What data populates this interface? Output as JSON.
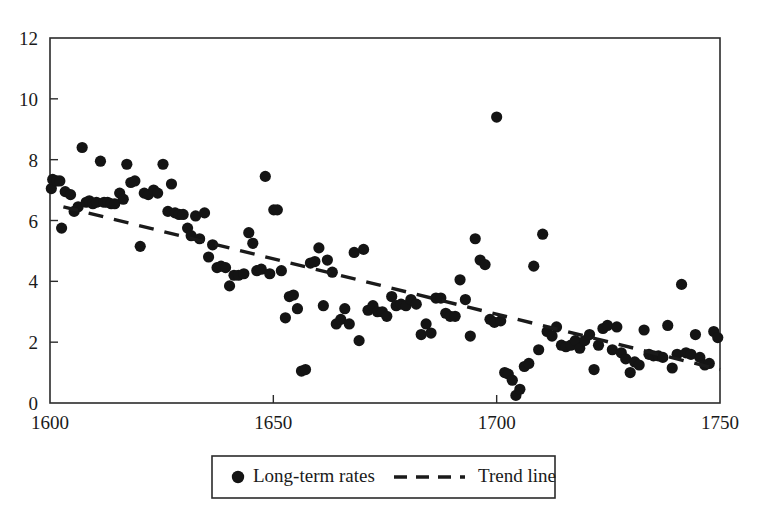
{
  "chart_data": {
    "type": "scatter",
    "title": "",
    "xlabel": "",
    "ylabel": "",
    "xlim": [
      1600,
      1750
    ],
    "ylim": [
      0,
      12
    ],
    "xticks": [
      1600,
      1650,
      1700,
      1750
    ],
    "xticklabels": [
      "1600",
      "1650",
      "1700",
      "1750"
    ],
    "yticks": [
      0,
      2,
      4,
      6,
      8,
      10,
      12
    ],
    "yticklabels": [
      "0",
      "2",
      "4",
      "6",
      "8",
      "10",
      "12"
    ],
    "grid": false,
    "legend_position": "below-axes",
    "marker_color": "#141414",
    "line_color": "#1a1a1a",
    "frame_color": "#2b2b2b",
    "series": [
      {
        "name": "Long-term rates",
        "type": "scatter",
        "marker": "circle",
        "points": [
          [
            1600.3,
            7.05
          ],
          [
            1600.6,
            7.35
          ],
          [
            1601.5,
            7.3
          ],
          [
            1602.2,
            7.3
          ],
          [
            1602.6,
            5.75
          ],
          [
            1603.4,
            6.95
          ],
          [
            1604.6,
            6.85
          ],
          [
            1605.4,
            6.3
          ],
          [
            1606.3,
            6.45
          ],
          [
            1607.2,
            8.4
          ],
          [
            1608.1,
            6.6
          ],
          [
            1608.8,
            6.65
          ],
          [
            1609.6,
            6.55
          ],
          [
            1610.4,
            6.6
          ],
          [
            1611.3,
            7.95
          ],
          [
            1612.1,
            6.6
          ],
          [
            1612.9,
            6.6
          ],
          [
            1613.7,
            6.55
          ],
          [
            1614.5,
            6.55
          ],
          [
            1615.6,
            6.9
          ],
          [
            1616.4,
            6.7
          ],
          [
            1617.2,
            7.85
          ],
          [
            1618.1,
            7.25
          ],
          [
            1619.0,
            7.3
          ],
          [
            1620.2,
            5.15
          ],
          [
            1621.1,
            6.9
          ],
          [
            1622.0,
            6.85
          ],
          [
            1623.2,
            7.0
          ],
          [
            1624.1,
            6.9
          ],
          [
            1625.3,
            7.85
          ],
          [
            1626.4,
            6.3
          ],
          [
            1627.2,
            7.2
          ],
          [
            1628.0,
            6.25
          ],
          [
            1628.9,
            6.2
          ],
          [
            1629.8,
            6.2
          ],
          [
            1630.8,
            5.75
          ],
          [
            1631.6,
            5.5
          ],
          [
            1632.6,
            6.15
          ],
          [
            1633.5,
            5.4
          ],
          [
            1634.6,
            6.25
          ],
          [
            1635.5,
            4.8
          ],
          [
            1636.4,
            5.2
          ],
          [
            1637.4,
            4.45
          ],
          [
            1638.3,
            4.5
          ],
          [
            1639.3,
            4.45
          ],
          [
            1640.2,
            3.85
          ],
          [
            1641.2,
            4.2
          ],
          [
            1642.2,
            4.2
          ],
          [
            1643.4,
            4.25
          ],
          [
            1644.5,
            5.6
          ],
          [
            1645.4,
            5.25
          ],
          [
            1646.3,
            4.35
          ],
          [
            1647.3,
            4.4
          ],
          [
            1648.2,
            7.45
          ],
          [
            1649.2,
            4.25
          ],
          [
            1650.1,
            6.35
          ],
          [
            1650.9,
            6.35
          ],
          [
            1651.8,
            4.35
          ],
          [
            1652.7,
            2.8
          ],
          [
            1653.6,
            3.5
          ],
          [
            1654.5,
            3.55
          ],
          [
            1655.4,
            3.1
          ],
          [
            1656.3,
            1.05
          ],
          [
            1657.2,
            1.1
          ],
          [
            1658.3,
            4.6
          ],
          [
            1659.3,
            4.65
          ],
          [
            1660.2,
            5.1
          ],
          [
            1661.2,
            3.2
          ],
          [
            1662.1,
            4.7
          ],
          [
            1663.2,
            4.3
          ],
          [
            1664.1,
            2.6
          ],
          [
            1665.1,
            2.75
          ],
          [
            1666.0,
            3.1
          ],
          [
            1667.0,
            2.6
          ],
          [
            1668.1,
            4.95
          ],
          [
            1669.2,
            2.05
          ],
          [
            1670.2,
            5.05
          ],
          [
            1671.2,
            3.05
          ],
          [
            1672.3,
            3.2
          ],
          [
            1673.3,
            3.0
          ],
          [
            1674.4,
            3.0
          ],
          [
            1675.4,
            2.85
          ],
          [
            1676.5,
            3.5
          ],
          [
            1677.5,
            3.2
          ],
          [
            1678.6,
            3.25
          ],
          [
            1679.7,
            3.2
          ],
          [
            1680.8,
            3.4
          ],
          [
            1682.0,
            3.25
          ],
          [
            1683.1,
            2.25
          ],
          [
            1684.2,
            2.6
          ],
          [
            1685.3,
            2.3
          ],
          [
            1686.4,
            3.45
          ],
          [
            1687.5,
            3.45
          ],
          [
            1688.6,
            2.95
          ],
          [
            1689.6,
            2.85
          ],
          [
            1690.7,
            2.85
          ],
          [
            1691.8,
            4.05
          ],
          [
            1693.0,
            3.4
          ],
          [
            1694.1,
            2.2
          ],
          [
            1695.2,
            5.4
          ],
          [
            1696.3,
            4.7
          ],
          [
            1697.4,
            4.55
          ],
          [
            1698.5,
            2.75
          ],
          [
            1699.5,
            2.65
          ],
          [
            1700.0,
            9.4
          ],
          [
            1700.9,
            2.7
          ],
          [
            1701.8,
            1.0
          ],
          [
            1702.6,
            0.95
          ],
          [
            1703.5,
            0.75
          ],
          [
            1704.3,
            0.25
          ],
          [
            1705.2,
            0.45
          ],
          [
            1706.2,
            1.2
          ],
          [
            1707.2,
            1.3
          ],
          [
            1708.3,
            4.5
          ],
          [
            1709.4,
            1.75
          ],
          [
            1710.3,
            5.55
          ],
          [
            1711.3,
            2.35
          ],
          [
            1712.4,
            2.2
          ],
          [
            1713.4,
            2.5
          ],
          [
            1714.5,
            1.9
          ],
          [
            1715.5,
            1.85
          ],
          [
            1716.6,
            1.9
          ],
          [
            1717.6,
            2.05
          ],
          [
            1718.6,
            1.8
          ],
          [
            1719.7,
            2.05
          ],
          [
            1720.8,
            2.25
          ],
          [
            1721.8,
            1.1
          ],
          [
            1722.8,
            1.9
          ],
          [
            1723.8,
            2.45
          ],
          [
            1724.8,
            2.55
          ],
          [
            1725.9,
            1.75
          ],
          [
            1726.9,
            2.5
          ],
          [
            1727.9,
            1.65
          ],
          [
            1728.9,
            1.45
          ],
          [
            1729.9,
            1.0
          ],
          [
            1730.9,
            1.35
          ],
          [
            1731.9,
            1.25
          ],
          [
            1733.0,
            2.4
          ],
          [
            1734.1,
            1.6
          ],
          [
            1735.1,
            1.55
          ],
          [
            1736.2,
            1.55
          ],
          [
            1737.2,
            1.5
          ],
          [
            1738.3,
            2.55
          ],
          [
            1739.3,
            1.15
          ],
          [
            1740.4,
            1.6
          ],
          [
            1741.4,
            3.9
          ],
          [
            1742.4,
            1.65
          ],
          [
            1743.5,
            1.6
          ],
          [
            1744.5,
            2.25
          ],
          [
            1745.5,
            1.5
          ],
          [
            1746.6,
            1.25
          ],
          [
            1747.6,
            1.3
          ],
          [
            1748.6,
            2.35
          ],
          [
            1749.5,
            2.15
          ]
        ]
      },
      {
        "name": "Trend line",
        "type": "line",
        "style": "dashed",
        "endpoints": [
          [
            1603,
            6.45
          ],
          [
            1750,
            1.1
          ]
        ]
      }
    ]
  },
  "legend": {
    "entries": [
      {
        "label": "Long-term rates",
        "marker": "circle"
      },
      {
        "label": "Trend line",
        "marker": "dashed-line"
      }
    ]
  }
}
